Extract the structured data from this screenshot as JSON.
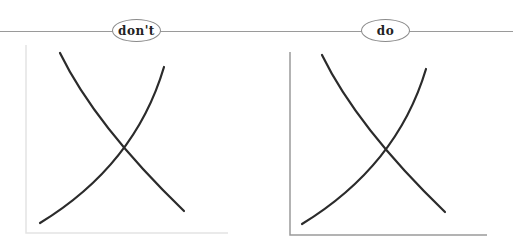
{
  "header": {
    "left_label": "don't",
    "right_label": "do"
  },
  "panels": [
    {
      "label": "don't",
      "axis_color": "#e4e4e4",
      "curve_color": "#2b2b2b",
      "axes": {
        "x0": 26,
        "y_top": 45,
        "y_bottom": 233,
        "x_right": 228
      },
      "curves": [
        {
          "name": "downward-curve",
          "path": "M60,53 Q95,125 184,211"
        },
        {
          "name": "upward-curve",
          "path": "M40,223 Q135,165 164,67"
        }
      ]
    },
    {
      "label": "do",
      "axis_color": "#9a9a9a",
      "curve_color": "#2b2b2b",
      "axes": {
        "x0": 290,
        "y_top": 52,
        "y_bottom": 235,
        "x_right": 487
      },
      "curves": [
        {
          "name": "downward-curve",
          "path": "M322,55 Q357,127 445,212"
        },
        {
          "name": "upward-curve",
          "path": "M302,224 Q397,166 426,69"
        }
      ]
    }
  ]
}
